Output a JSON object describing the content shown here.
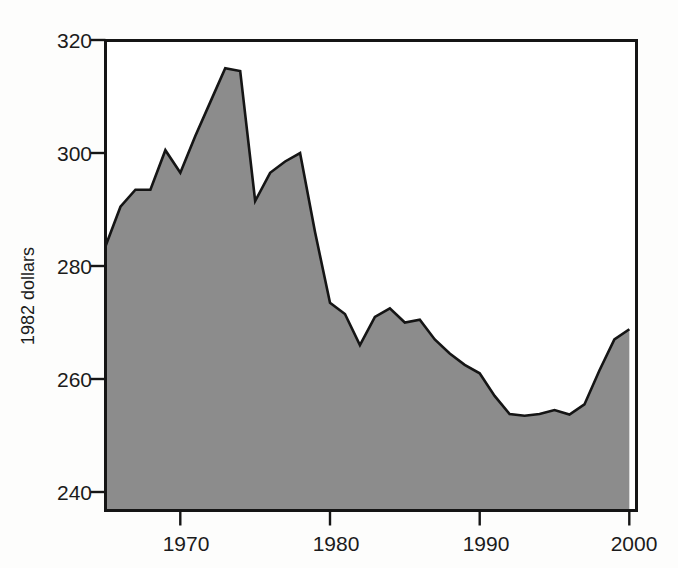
{
  "chart_data": {
    "type": "area",
    "title": "",
    "subtitle": "",
    "xlabel": "",
    "ylabel": "1982 dollars",
    "xlim": [
      1965,
      2000
    ],
    "ylim": [
      236,
      322
    ],
    "grid": false,
    "legend": "none",
    "fill_color": "#8c8c8c",
    "line_color": "#151515",
    "axis_color": "#151515",
    "background_color": "#fdfdfc",
    "x_ticks": [
      1970,
      1980,
      1990,
      2000
    ],
    "x_tick_labels": [
      "1970",
      "1980",
      "1990",
      "2000"
    ],
    "y_ticks": [
      240,
      260,
      280,
      300,
      320
    ],
    "y_tick_labels": [
      "240",
      "260",
      "280",
      "300",
      "320"
    ],
    "x": [
      1965,
      1966,
      1967,
      1968,
      1969,
      1970,
      1971,
      1972,
      1973,
      1974,
      1975,
      1976,
      1977,
      1978,
      1979,
      1980,
      1981,
      1982,
      1983,
      1984,
      1985,
      1986,
      1987,
      1988,
      1989,
      1990,
      1991,
      1992,
      1993,
      1994,
      1995,
      1996,
      1997,
      1998,
      1999,
      2000
    ],
    "values": [
      283.5,
      290.5,
      293.5,
      293.5,
      300.5,
      296.5,
      303.0,
      309.0,
      315.0,
      314.5,
      291.5,
      296.5,
      298.5,
      300.0,
      286.0,
      273.5,
      271.5,
      266.0,
      271.0,
      272.5,
      270.0,
      270.5,
      267.0,
      264.5,
      262.5,
      261.0,
      257.0,
      253.8,
      253.5,
      253.8,
      254.5,
      253.7,
      255.5,
      261.5,
      267.0,
      268.8
    ]
  },
  "chart": {
    "y_axis_title": "1982 dollars",
    "x_tick_1": "1970",
    "x_tick_2": "1980",
    "x_tick_3": "1990",
    "x_tick_4": "2000",
    "y_tick_1": "240",
    "y_tick_2": "260",
    "y_tick_3": "280",
    "y_tick_4": "300",
    "y_tick_5": "320"
  }
}
